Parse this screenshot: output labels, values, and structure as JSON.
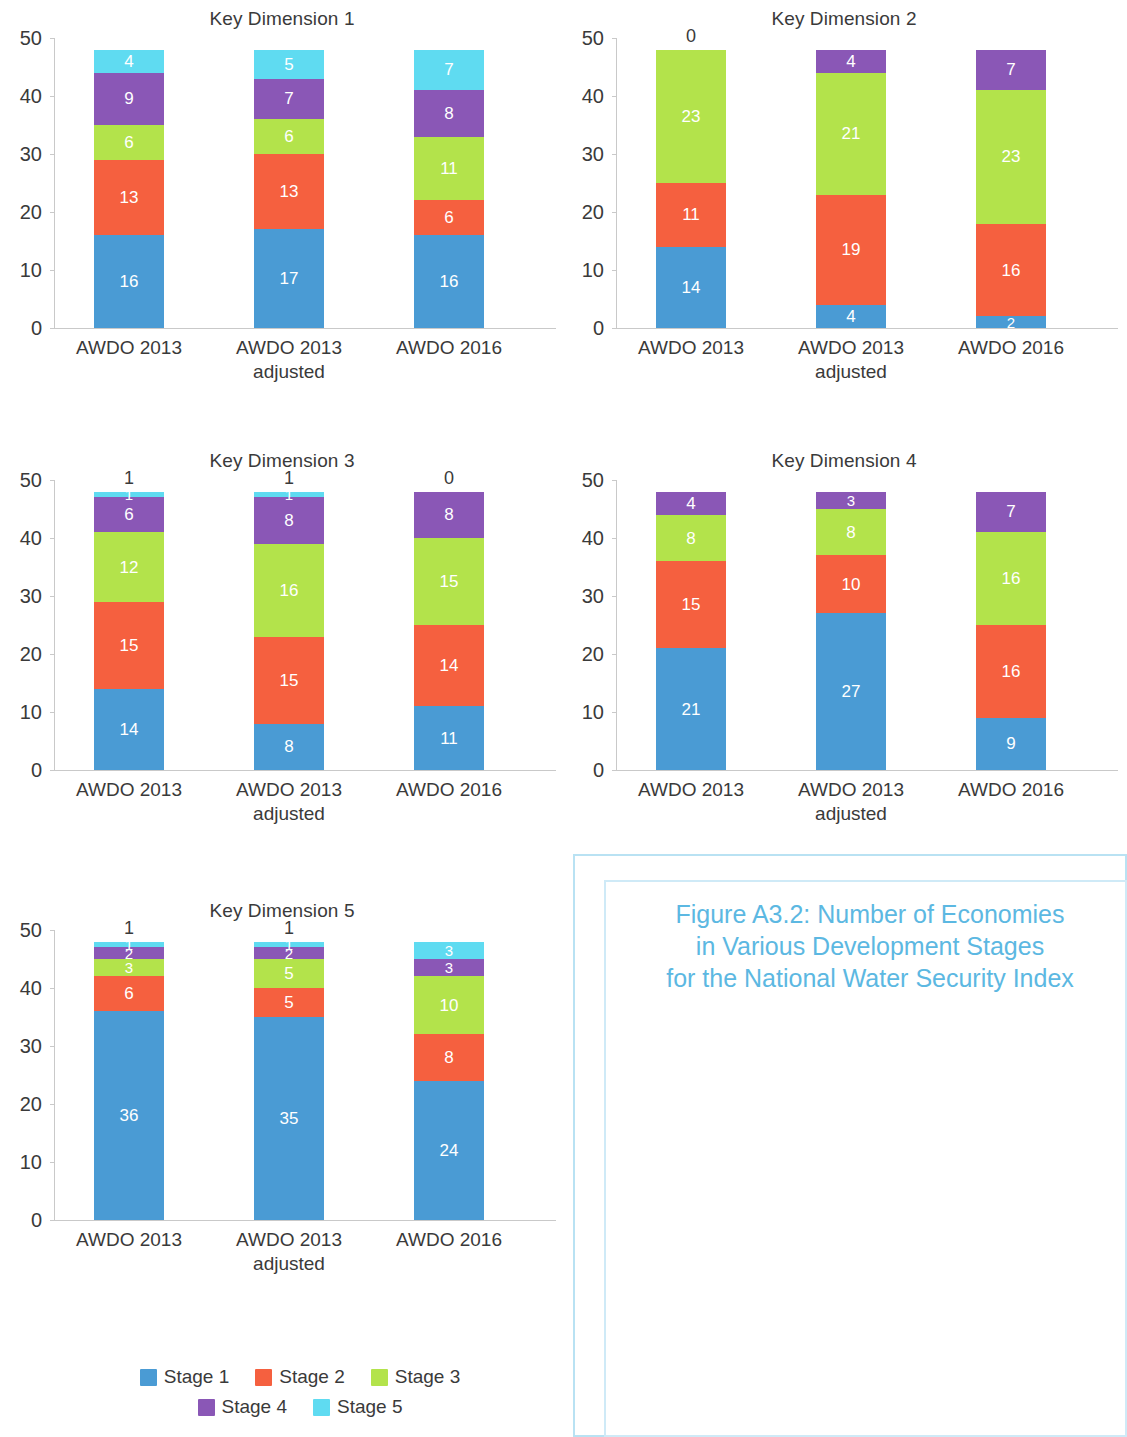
{
  "legend": {
    "items": [
      {
        "label": "Stage 1",
        "color": "#4a9bd4"
      },
      {
        "label": "Stage 2",
        "color": "#f5603f"
      },
      {
        "label": "Stage 3",
        "color": "#b3e34b"
      },
      {
        "label": "Stage 4",
        "color": "#8a57b6"
      },
      {
        "label": "Stage 5",
        "color": "#5fdbf1"
      }
    ]
  },
  "inset": {
    "title_line1": "Figure A3.2: Number of Economies",
    "title_line2": "in Various Development Stages",
    "title_line3": "for the National Water Security Index",
    "title_color": "#5cb8e2",
    "border_color": "#b9e2f3"
  },
  "axis": {
    "yticks": [
      "0",
      "10",
      "20",
      "30",
      "40",
      "50"
    ],
    "ymin": 0,
    "ymax": 50
  },
  "categories": [
    "AWDO 2013",
    "AWDO 2013\nadjusted",
    "AWDO 2016"
  ],
  "chart_data": [
    {
      "type": "bar",
      "stacked": true,
      "title": "Key Dimension 1",
      "xlabel": "",
      "ylabel": "",
      "ylim": [
        0,
        50
      ],
      "grid": false,
      "legend_position": "bottom",
      "categories": [
        "AWDO 2013",
        "AWDO 2013 adjusted",
        "AWDO 2016"
      ],
      "series": [
        {
          "name": "Stage 1",
          "color": "#4a9bd4",
          "values": [
            16,
            17,
            16
          ]
        },
        {
          "name": "Stage 2",
          "color": "#f5603f",
          "values": [
            13,
            13,
            6
          ]
        },
        {
          "name": "Stage 3",
          "color": "#b3e34b",
          "values": [
            6,
            6,
            11
          ]
        },
        {
          "name": "Stage 4",
          "color": "#8a57b6",
          "values": [
            9,
            7,
            8
          ]
        },
        {
          "name": "Stage 5",
          "color": "#5fdbf1",
          "values": [
            4,
            5,
            7
          ]
        }
      ],
      "totals": [
        48,
        48,
        48
      ],
      "outside_labels": [
        null,
        null,
        null
      ]
    },
    {
      "type": "bar",
      "stacked": true,
      "title": "Key Dimension 2",
      "xlabel": "",
      "ylabel": "",
      "ylim": [
        0,
        50
      ],
      "grid": false,
      "legend_position": "bottom",
      "categories": [
        "AWDO 2013",
        "AWDO 2013 adjusted",
        "AWDO 2016"
      ],
      "series": [
        {
          "name": "Stage 1",
          "color": "#4a9bd4",
          "values": [
            14,
            4,
            2
          ]
        },
        {
          "name": "Stage 2",
          "color": "#f5603f",
          "values": [
            11,
            19,
            16
          ]
        },
        {
          "name": "Stage 3",
          "color": "#b3e34b",
          "values": [
            23,
            21,
            23
          ]
        },
        {
          "name": "Stage 4",
          "color": "#8a57b6",
          "values": [
            0,
            4,
            7
          ]
        },
        {
          "name": "Stage 5",
          "color": "#5fdbf1",
          "values": [
            0,
            0,
            0
          ]
        }
      ],
      "totals": [
        48,
        48,
        48
      ],
      "outside_labels": [
        "0",
        null,
        null
      ]
    },
    {
      "type": "bar",
      "stacked": true,
      "title": "Key Dimension 3",
      "xlabel": "",
      "ylabel": "",
      "ylim": [
        0,
        50
      ],
      "grid": false,
      "legend_position": "bottom",
      "categories": [
        "AWDO 2013",
        "AWDO 2013 adjusted",
        "AWDO 2016"
      ],
      "series": [
        {
          "name": "Stage 1",
          "color": "#4a9bd4",
          "values": [
            14,
            8,
            11
          ]
        },
        {
          "name": "Stage 2",
          "color": "#f5603f",
          "values": [
            15,
            15,
            14
          ]
        },
        {
          "name": "Stage 3",
          "color": "#b3e34b",
          "values": [
            12,
            16,
            15
          ]
        },
        {
          "name": "Stage 4",
          "color": "#8a57b6",
          "values": [
            6,
            8,
            8
          ]
        },
        {
          "name": "Stage 5",
          "color": "#5fdbf1",
          "values": [
            1,
            1,
            0
          ]
        }
      ],
      "totals": [
        48,
        48,
        48
      ],
      "outside_labels": [
        "1",
        "1",
        "0"
      ]
    },
    {
      "type": "bar",
      "stacked": true,
      "title": "Key Dimension 4",
      "xlabel": "",
      "ylabel": "",
      "ylim": [
        0,
        50
      ],
      "grid": false,
      "legend_position": "bottom",
      "categories": [
        "AWDO 2013",
        "AWDO 2013 adjusted",
        "AWDO 2016"
      ],
      "series": [
        {
          "name": "Stage 1",
          "color": "#4a9bd4",
          "values": [
            21,
            27,
            9
          ]
        },
        {
          "name": "Stage 2",
          "color": "#f5603f",
          "values": [
            15,
            10,
            16
          ]
        },
        {
          "name": "Stage 3",
          "color": "#b3e34b",
          "values": [
            8,
            8,
            16
          ]
        },
        {
          "name": "Stage 4",
          "color": "#8a57b6",
          "values": [
            4,
            3,
            7
          ]
        },
        {
          "name": "Stage 5",
          "color": "#5fdbf1",
          "values": [
            0,
            0,
            0
          ]
        }
      ],
      "totals": [
        48,
        48,
        48
      ],
      "outside_labels": [
        null,
        null,
        null
      ]
    },
    {
      "type": "bar",
      "stacked": true,
      "title": "Key Dimension 5",
      "xlabel": "",
      "ylabel": "",
      "ylim": [
        0,
        50
      ],
      "grid": false,
      "legend_position": "bottom",
      "categories": [
        "AWDO 2013",
        "AWDO 2013 adjusted",
        "AWDO 2016"
      ],
      "series": [
        {
          "name": "Stage 1",
          "color": "#4a9bd4",
          "values": [
            36,
            35,
            24
          ]
        },
        {
          "name": "Stage 2",
          "color": "#f5603f",
          "values": [
            6,
            5,
            8
          ]
        },
        {
          "name": "Stage 3",
          "color": "#b3e34b",
          "values": [
            3,
            5,
            10
          ]
        },
        {
          "name": "Stage 4",
          "color": "#8a57b6",
          "values": [
            2,
            2,
            3
          ]
        },
        {
          "name": "Stage 5",
          "color": "#5fdbf1",
          "values": [
            1,
            1,
            3
          ]
        }
      ],
      "totals": [
        48,
        48,
        48
      ],
      "outside_labels": [
        "1",
        "1",
        null
      ]
    },
    {
      "type": "bar",
      "stacked": true,
      "title": "Figure A3.2: Number of Economies in Various Development Stages for the National Water Security Index",
      "xlabel": "",
      "ylabel": "",
      "ylim": [
        0,
        50
      ],
      "grid": false,
      "legend_position": "none",
      "categories": [
        "AWDO 2013",
        "AWDO 2013 adjusted",
        "AWDO 2016"
      ],
      "series": [
        {
          "name": "Stage 1",
          "color": "#4a9bd4",
          "values": [
            12,
            12,
            5
          ]
        },
        {
          "name": "Stage 2",
          "color": "#f5603f",
          "values": [
            26,
            24,
            24
          ]
        },
        {
          "name": "Stage 3",
          "color": "#b3e34b",
          "values": [
            8,
            9,
            14
          ]
        },
        {
          "name": "Stage 4",
          "color": "#8a57b6",
          "values": [
            2,
            3,
            5
          ]
        },
        {
          "name": "Stage 5",
          "color": "#5fdbf1",
          "values": [
            0,
            0,
            0
          ]
        }
      ],
      "totals": [
        48,
        48,
        48
      ],
      "outside_labels": [
        "0",
        "0",
        "0"
      ]
    }
  ]
}
